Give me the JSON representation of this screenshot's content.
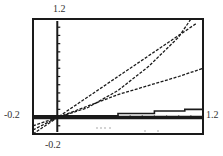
{
  "labels": {
    "ymax": "1.2",
    "ymin": "-0.2",
    "xmin": "-0.2",
    "xmax": "1.2"
  },
  "chart_data": {
    "type": "line",
    "title": "",
    "xlabel": "",
    "ylabel": "",
    "xlim": [
      -0.2,
      1.2
    ],
    "ylim": [
      -0.2,
      1.2
    ],
    "grid": false,
    "axis_ticks": {
      "x_step": 0.1,
      "y_step": 0.1
    },
    "series": [
      {
        "name": "line-y-equals-x",
        "style": "dashed",
        "x": [
          -0.2,
          0,
          0.5,
          1.0,
          1.15
        ],
        "y": [
          -0.2,
          0,
          0.5,
          1.0,
          1.15
        ]
      },
      {
        "name": "convex-curve",
        "style": "dashed",
        "x": [
          -0.2,
          0,
          0.25,
          0.5,
          0.75,
          1.0,
          1.1
        ],
        "y": [
          -0.15,
          0,
          0.12,
          0.33,
          0.62,
          0.98,
          1.2
        ]
      },
      {
        "name": "line-half-slope",
        "style": "dashed",
        "x": [
          -0.2,
          0,
          0.5,
          1.0,
          1.2
        ],
        "y": [
          -0.1,
          0,
          0.28,
          0.5,
          0.6
        ]
      },
      {
        "name": "step-function",
        "style": "solid",
        "x": [
          -0.2,
          0,
          0.5,
          0.5,
          0.8,
          0.8,
          1.05,
          1.05,
          1.2
        ],
        "y": [
          0.02,
          0.02,
          0.02,
          0.05,
          0.05,
          0.08,
          0.08,
          0.1,
          0.1
        ]
      },
      {
        "name": "baseline-zero",
        "style": "thick",
        "x": [
          -0.2,
          1.2
        ],
        "y": [
          0,
          0
        ]
      }
    ]
  },
  "colors": {
    "ink": "#1a1a1a",
    "background": "#ffffff"
  }
}
